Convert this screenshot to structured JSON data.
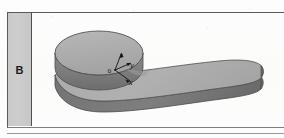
{
  "figure": {
    "row_label": "B",
    "caption_present": false,
    "object_name": "cylinder-with-tapered-handle",
    "axes": {
      "origin_label": "o",
      "labels": [
        "x",
        "y",
        "z"
      ],
      "z_label": "z",
      "y_label": "y",
      "x_label": "x",
      "triad_type": "right-handed-isometric"
    },
    "colors": {
      "top_face": "#ababab",
      "top_face_highlight": "#b6b6b6",
      "side_face": "#7c7c7c",
      "side_face_dark": "#6e6e6e",
      "outline": "#4a4a4a",
      "label_cell_fill": "#c9c9c9",
      "frame_rule": "#5a5a5a",
      "page_background": "#fdfdfd"
    }
  }
}
